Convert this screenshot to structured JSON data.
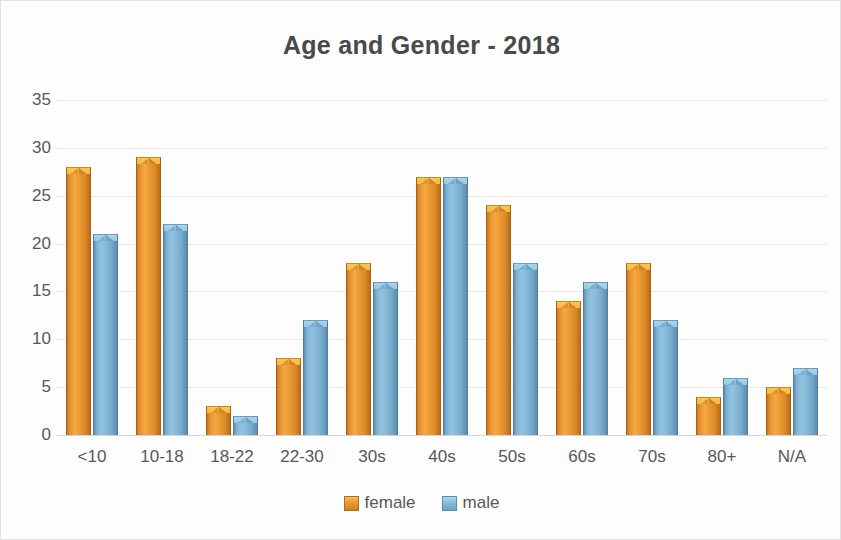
{
  "chart_data": {
    "type": "bar",
    "title": "Age and Gender - 2018",
    "xlabel": "",
    "ylabel": "",
    "categories": [
      "<10",
      "10-18",
      "18-22",
      "22-30",
      "30s",
      "40s",
      "50s",
      "60s",
      "70s",
      "80+",
      "N/A"
    ],
    "series": [
      {
        "name": "female",
        "color": "#E8922E",
        "values": [
          28,
          29,
          3,
          8,
          18,
          27,
          24,
          14,
          18,
          4,
          5
        ]
      },
      {
        "name": "male",
        "color": "#7FB2D3",
        "values": [
          21,
          22,
          2,
          12,
          16,
          27,
          18,
          16,
          12,
          6,
          7
        ]
      }
    ],
    "ylim": [
      0,
      35
    ],
    "yticks": [
      0,
      5,
      10,
      15,
      20,
      25,
      30,
      35
    ],
    "grid": true,
    "legend_position": "bottom"
  },
  "legend": {
    "items": [
      {
        "label": "female"
      },
      {
        "label": "male"
      }
    ]
  }
}
